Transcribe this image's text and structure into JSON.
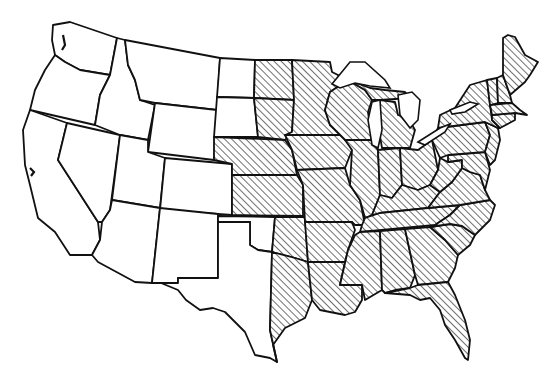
{
  "map": {
    "subject": "Contiguous United States",
    "style": "black-and-white outline map with diagonal hatching",
    "colors": {
      "outline": "#111111",
      "background": "#ffffff",
      "hatch": "#222222"
    },
    "shaded_regions": [
      "North Dakota (east)",
      "South Dakota (east)",
      "Nebraska",
      "Kansas",
      "Oklahoma (east)",
      "Texas (east)",
      "Minnesota",
      "Iowa",
      "Missouri",
      "Arkansas",
      "Louisiana",
      "Wisconsin",
      "Illinois",
      "Michigan",
      "Indiana",
      "Ohio",
      "Kentucky",
      "Tennessee",
      "Mississippi",
      "Alabama",
      "Georgia",
      "Florida",
      "South Carolina",
      "North Carolina",
      "Virginia",
      "West Virginia",
      "Maryland",
      "Delaware",
      "Pennsylvania",
      "New Jersey",
      "New York",
      "Connecticut",
      "Rhode Island",
      "Massachusetts",
      "Vermont",
      "New Hampshire",
      "Maine"
    ],
    "unshaded_regions": [
      "Washington",
      "Oregon",
      "California",
      "Nevada",
      "Idaho",
      "Montana",
      "Wyoming",
      "Utah",
      "Colorado",
      "Arizona",
      "New Mexico",
      "North Dakota (west)",
      "South Dakota (west)",
      "Oklahoma (west)",
      "Texas (west)"
    ]
  }
}
